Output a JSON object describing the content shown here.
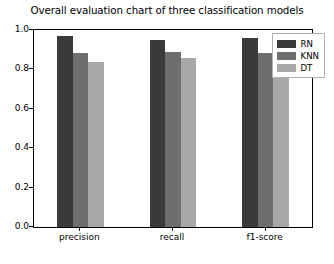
{
  "chart_data": {
    "type": "bar",
    "title": "Overall evaluation chart of three classification models",
    "xlabel": "",
    "ylabel": "",
    "categories": [
      "precision",
      "recall",
      "f1-score"
    ],
    "series": [
      {
        "name": "RN",
        "values": [
          0.97,
          0.95,
          0.96
        ],
        "color": "#3a3a3a"
      },
      {
        "name": "KNN",
        "values": [
          0.885,
          0.89,
          0.885
        ],
        "color": "#6e6e6e"
      },
      {
        "name": "DT",
        "values": [
          0.84,
          0.86,
          0.85
        ],
        "color": "#a8a8a8"
      }
    ],
    "ylim": [
      0.0,
      1.0
    ],
    "yticks": [
      0.0,
      0.2,
      0.4,
      0.6,
      0.8,
      1.0
    ],
    "ytick_labels": [
      "0.0",
      "0.2",
      "0.4",
      "0.6",
      "0.8",
      "1.0"
    ],
    "grid": false,
    "legend_position": "upper right"
  },
  "legend": {
    "entries": [
      {
        "label": "RN"
      },
      {
        "label": "KNN"
      },
      {
        "label": "DT"
      }
    ]
  }
}
